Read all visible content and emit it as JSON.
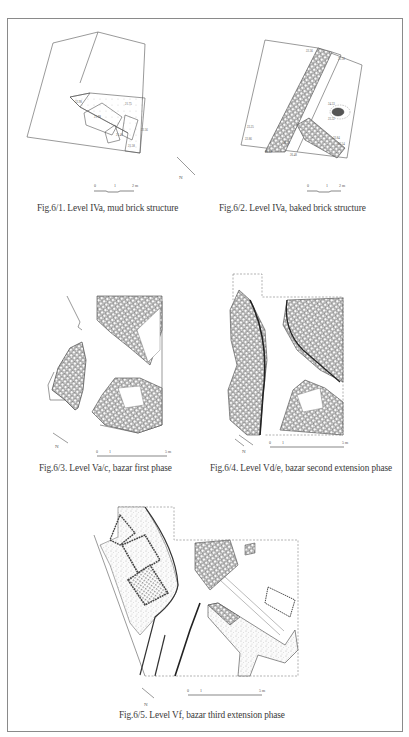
{
  "page": {
    "background": "#ffffff",
    "border_color": "#8a8a8a",
    "text_color": "#3a3a3a"
  },
  "figures": [
    {
      "id": "fig-6-1",
      "caption": "Fig.6/1. Level IVa, mud brick structure",
      "scale_labels": [
        "0",
        "1",
        "2 m"
      ],
      "north_label": "N",
      "elevation_labels": [
        "21.75",
        "22.98",
        "21.98",
        "21.40",
        "22.56",
        "21.58"
      ]
    },
    {
      "id": "fig-6-2",
      "caption": "Fig.6/2. Level IVa, baked brick structure",
      "scale_labels": [
        "0",
        "1",
        "2 m"
      ],
      "elevation_labels": [
        "22.56",
        "22.58",
        "24.33",
        "23.32",
        "23.25",
        "22.86",
        "22.84",
        "26.20",
        "26.22",
        "26.48",
        "22.54"
      ]
    },
    {
      "id": "fig-6-3",
      "caption": "Fig.6/3. Level Va/c, bazar first phase",
      "scale_labels": [
        "0",
        "1",
        "5 m"
      ],
      "north_label": "N"
    },
    {
      "id": "fig-6-4",
      "caption": "Fig.6/4. Level Vd/e, bazar second extension phase",
      "scale_labels": [
        "0",
        "1",
        "5 m"
      ],
      "north_label": "N"
    },
    {
      "id": "fig-6-5",
      "caption": "Fig.6/5. Level Vf, bazar third extension phase",
      "scale_labels": [
        "0",
        "1",
        "5 m"
      ],
      "north_label": "N"
    }
  ]
}
